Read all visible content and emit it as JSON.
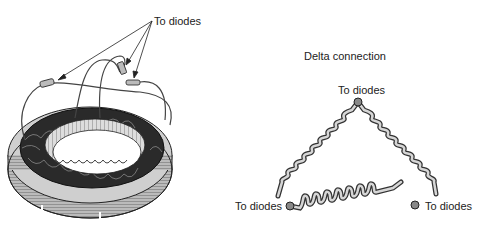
{
  "stator": {
    "label": "To diodes",
    "lead_count": 3
  },
  "delta": {
    "title": "Delta connection",
    "top_label": "To diodes",
    "left_label": "To diodes",
    "right_label": "To diodes"
  },
  "colors": {
    "ink": "#222222",
    "wire_fill": "#d0d0d0",
    "terminal": "#808080"
  }
}
